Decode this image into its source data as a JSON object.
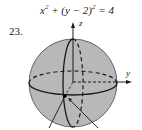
{
  "equation": {
    "lhs_x": "x",
    "exp_x": "2",
    "plus": " + (",
    "lhs_y": "y",
    "minus": " − 2)",
    "exp_y": "2",
    "rhs": " = 4"
  },
  "problem_number": "23.",
  "figure": {
    "type": "sphere-diagram",
    "axis_labels": {
      "z": "z",
      "y": "y"
    },
    "fill_color": "#b8b8b8",
    "line_color": "#1a1a1a"
  }
}
